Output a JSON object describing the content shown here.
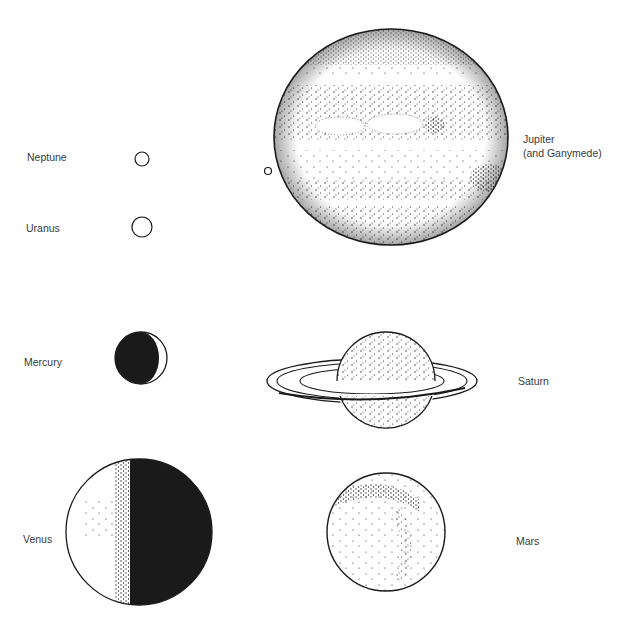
{
  "colors": {
    "ink": "#1a1a1a",
    "label": "#3a3a3a",
    "background": "#ffffff"
  },
  "planets": [
    {
      "id": "neptune",
      "label": "Neptune",
      "cx": 142,
      "cy": 159,
      "r": 7
    },
    {
      "id": "uranus",
      "label": "Uranus",
      "cx": 142,
      "cy": 227,
      "r": 10
    },
    {
      "id": "jupiter",
      "label": "Jupiter",
      "label2": "(and Ganymede)",
      "cx": 391,
      "cy": 137,
      "rx": 117,
      "ry": 108,
      "moon": {
        "name": "Ganymede",
        "cx": 268,
        "cy": 171,
        "r": 3.5
      }
    },
    {
      "id": "mercury",
      "label": "Mercury",
      "cx": 141,
      "cy": 358,
      "r": 26
    },
    {
      "id": "saturn",
      "label": "Saturn",
      "cx": 386,
      "cy": 380,
      "r": 49,
      "rings": {
        "cx": 372,
        "cy": 381,
        "rx": 105,
        "ry": 22
      }
    },
    {
      "id": "venus",
      "label": "Venus",
      "cx": 139,
      "cy": 532,
      "r": 73
    },
    {
      "id": "mars",
      "label": "Mars",
      "cx": 386,
      "cy": 532,
      "r": 59
    }
  ]
}
